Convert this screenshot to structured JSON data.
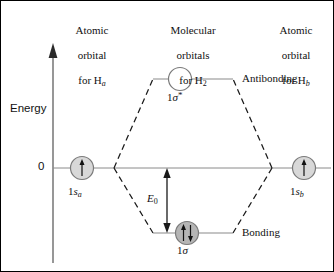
{
  "figure": {
    "title_columns": [
      {
        "name": "left-atomic-orbital-header",
        "line1": "Atomic",
        "line2": "orbital",
        "line3_prefix": "for H",
        "line3_sub": "a"
      },
      {
        "name": "molecular-orbitals-header",
        "line1": "Molecular",
        "line2": "orbitals",
        "line3_prefix": "for H",
        "line3_sub": "2"
      },
      {
        "name": "right-atomic-orbital-header",
        "line1": "Atomic",
        "line2": "orbital",
        "line3_prefix": "for H",
        "line3_sub": "b"
      }
    ],
    "axis": {
      "label": "Energy",
      "zero_tick": "0"
    },
    "levels": {
      "antibonding": {
        "label_prefix": "1",
        "label_sigma": "σ",
        "label_star": "*",
        "side_label": "Antibonding",
        "occupancy": "empty",
        "electrons": 0,
        "fill_color": "#ffffff"
      },
      "bonding": {
        "label_prefix": "1",
        "label_sigma": "σ",
        "side_label": "Bonding",
        "occupancy": "paired",
        "electrons": 2,
        "fill_color": "#b5b5b5"
      },
      "left_atomic": {
        "label_prefix": "1",
        "label_s": "s",
        "label_sub": "a",
        "occupancy": "single",
        "electrons": 1,
        "fill_color": "#d8d8d8"
      },
      "right_atomic": {
        "label_prefix": "1",
        "label_s": "s",
        "label_sub": "b",
        "occupancy": "single",
        "electrons": 1,
        "fill_color": "#d8d8d8"
      }
    },
    "annotations": {
      "splitting_energy_symbol": "E",
      "splitting_energy_sub": "0"
    },
    "colors": {
      "line": "#6b6b6b",
      "dashed": "#1a1a1a",
      "text": "#111111",
      "axis": "#6b6b6b",
      "circle_stroke": "#7a7a7a",
      "arrow": "#1a1a1a"
    }
  }
}
